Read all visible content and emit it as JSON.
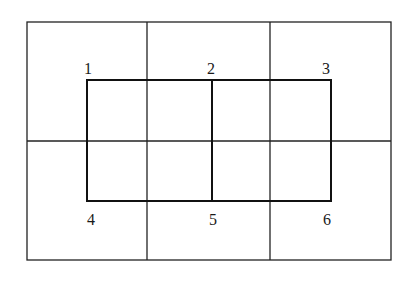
{
  "diagram": {
    "outer_grid": {
      "left": 27,
      "top": 22,
      "right": 391,
      "bottom": 260,
      "v_lines": [
        147,
        270
      ],
      "h_lines": [
        141
      ]
    },
    "inner_rect": {
      "left": 87,
      "top": 80,
      "right": 331,
      "bottom": 201,
      "mid_v": 212
    },
    "labels": [
      {
        "text": "1",
        "x": 84,
        "y": 74
      },
      {
        "text": "2",
        "x": 207,
        "y": 74
      },
      {
        "text": "3",
        "x": 322,
        "y": 74
      },
      {
        "text": "4",
        "x": 87,
        "y": 225
      },
      {
        "text": "5",
        "x": 209,
        "y": 225
      },
      {
        "text": "6",
        "x": 323,
        "y": 225
      }
    ],
    "line_color": "#1a1a1a"
  }
}
